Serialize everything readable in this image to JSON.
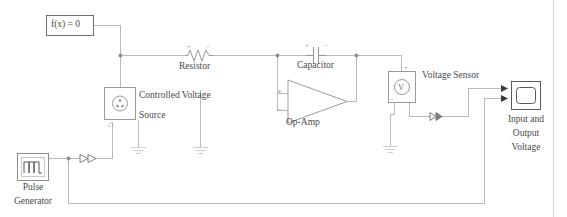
{
  "diagram": {
    "background": "#ffffff",
    "wire_color": "#b9b9b9",
    "block_border": "#8d8d8d",
    "text_color": "#4a4a4a",
    "border_line_color": "#d0d0d0"
  },
  "blocks": {
    "solver": {
      "label": "f(x) = 0",
      "name": "solver-configuration-block",
      "x": 46,
      "y": 15,
      "w": 48,
      "h": 21
    },
    "controlled_voltage_source": {
      "label_line1": "Controlled Voltage",
      "label_line2": "Source",
      "port_marker": "△",
      "icon": "circle-source-icon",
      "x": 104,
      "y": 87,
      "w": 31,
      "h": 33
    },
    "pulse_generator": {
      "label_line1": "Pulse",
      "label_line2": "Generator",
      "icon": "pulse-waveform-icon",
      "x": 17,
      "y": 153,
      "w": 32,
      "h": 27
    },
    "scope": {
      "label_line1": "Input and",
      "label_line2": "Output",
      "label_line3": "Voltage",
      "icon": "scope-screen-icon",
      "x": 511,
      "y": 81,
      "w": 30,
      "h": 29
    },
    "voltage_sensor": {
      "label": "Voltage Sensor",
      "icon": "voltmeter-icon",
      "glyph": "V",
      "plus": "+",
      "minus": "−",
      "x": 388,
      "y": 71,
      "w": 27,
      "h": 31
    },
    "resistor": {
      "label": "Resistor",
      "icon": "resistor-zigzag-icon",
      "plus": "+",
      "minus": "−",
      "x": 185,
      "y": 49
    },
    "capacitor": {
      "label": "Capacitor",
      "icon": "capacitor-plates-icon",
      "plus": "+",
      "minus": "−",
      "x": 296,
      "y": 40
    },
    "op_amp": {
      "label": "Op-Amp",
      "icon": "op-amp-triangle-icon",
      "plus": "+",
      "minus": "−",
      "x": 288,
      "y": 86
    },
    "grounds": [
      {
        "name": "ground-source",
        "x": 138,
        "y": 147
      },
      {
        "name": "ground-opamp",
        "x": 200,
        "y": 147
      },
      {
        "name": "ground-sensor",
        "x": 390,
        "y": 145
      }
    ]
  },
  "signal_arrows": [
    {
      "name": "signal-arrow-pulse-to-source",
      "x": 80,
      "y": 158
    },
    {
      "name": "signal-arrow-sensor-to-scope",
      "x": 430,
      "y": 116
    }
  ],
  "junctions": [
    {
      "name": "junction-solver-node",
      "x": 120,
      "y": 55
    },
    {
      "name": "junction-capacitor-right",
      "x": 356,
      "y": 55
    },
    {
      "name": "junction-capacitor-left",
      "x": 277,
      "y": 55
    },
    {
      "name": "junction-pulse-node",
      "x": 68,
      "y": 158
    }
  ]
}
